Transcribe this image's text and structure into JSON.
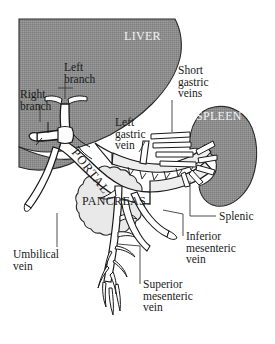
{
  "figure": {
    "type": "anatomical-diagram"
  },
  "organs": {
    "liver": {
      "name": "LIVER",
      "fill": "#8d8d8d"
    },
    "spleen": {
      "name": "SPLEEN",
      "fill": "#8d8d8d"
    },
    "pancreas": {
      "name": "PANCREAS",
      "fill": "#e3e3e3"
    }
  },
  "vessels": {
    "portal": "PORTAL",
    "right_branch": "Right\nbranch",
    "left_branch": "Left\nbranch",
    "left_gastric": "Left\ngastric\nvein",
    "short_gastric": "Short\ngastric\nveins",
    "splenic": "Splenic",
    "inferior_mesenteric": "Inferior\nmesenteric\nvein",
    "superior_mesenteric": "Superior\nmesenteric\nvein",
    "umbilical": "Umbilical\nvein"
  },
  "colors": {
    "organ_gray": "#8d8d8d",
    "pancreas_gray": "#e3e3e3",
    "vessel_fill": "#fdfdfd",
    "outline": "#1a1a1a",
    "leader": "#4a4a4a",
    "background": "#ffffff"
  }
}
